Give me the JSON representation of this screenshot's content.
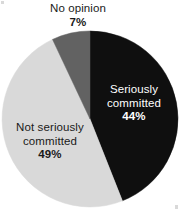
{
  "chart_data": {
    "type": "pie",
    "title": "",
    "subtitle": "",
    "xlabel": "",
    "ylabel": "",
    "legend_position": "none",
    "grid": false,
    "labels_inside": true,
    "start_angle_deg": 0,
    "direction": "clockwise",
    "categories": [
      "Seriously committed",
      "Not seriously committed",
      "No opinion"
    ],
    "values": [
      44,
      49,
      7
    ],
    "value_suffix": "%",
    "slices": [
      {
        "name": "Seriously committed",
        "label_line1": "Seriously",
        "label_line2": "committed",
        "value": 44,
        "value_text": "44%",
        "color": "#0f0f0f",
        "text_color": "#ffffff",
        "start_deg": 0,
        "end_deg": 158.4
      },
      {
        "name": "Not seriously committed",
        "label_line1": "Not seriously",
        "label_line2": "committed",
        "value": 49,
        "value_text": "49%",
        "color": "#d9d9d9",
        "text_color": "#1a1a1a",
        "start_deg": 158.4,
        "end_deg": 334.8
      },
      {
        "name": "No opinion",
        "label_line1": "No opinion",
        "label_line2": "",
        "value": 7,
        "value_text": "7%",
        "color": "#626262",
        "text_color": "#1a1a1a",
        "start_deg": 334.8,
        "end_deg": 360
      }
    ]
  },
  "labels": {
    "no_opinion": {
      "name": "No opinion",
      "value_text": "7%"
    },
    "seriously_committed": {
      "name_line1": "Seriously",
      "name_line2": "committed",
      "value_text": "44%"
    },
    "not_seriously_committed": {
      "name_line1": "Not seriously",
      "name_line2": "committed",
      "value_text": "49%"
    }
  },
  "colors": {
    "seriously_committed": "#0f0f0f",
    "not_seriously_committed": "#d9d9d9",
    "no_opinion": "#626262",
    "background": "#ffffff",
    "text_dark": "#1a1a1a",
    "text_light": "#ffffff"
  }
}
